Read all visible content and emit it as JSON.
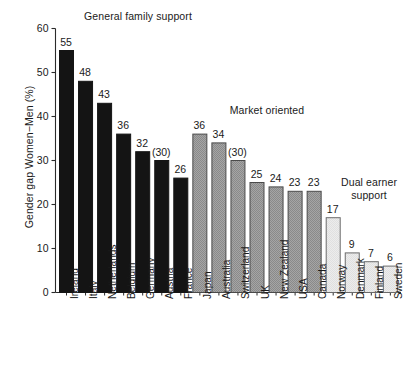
{
  "chart_data": {
    "type": "bar",
    "title": "",
    "xlabel": "",
    "ylabel": "Gender gap Women−Men (%)",
    "ylim": [
      0,
      60
    ],
    "ytick_values": [
      0,
      10,
      20,
      30,
      40,
      50,
      60
    ],
    "ytick_labels": [
      "0",
      "10",
      "20",
      "30",
      "40",
      "50",
      "60"
    ],
    "grid": false,
    "legend": "none",
    "categories": [
      "Ireland",
      "Italy",
      "Netherlands",
      "Belgium",
      "Germany",
      "Austria",
      "France",
      "Japan",
      "Australia",
      "Switzerland",
      "UK",
      "New Zealand",
      "USA",
      "Canada",
      "Norway",
      "Denmark",
      "Finland",
      "Sweden"
    ],
    "values": [
      55,
      48,
      43,
      36,
      32,
      30,
      26,
      36,
      34,
      30,
      25,
      24,
      23,
      23,
      17,
      9,
      7,
      6
    ],
    "value_labels": [
      "55",
      "48",
      "43",
      "36",
      "32",
      "(30)",
      "26",
      "36",
      "34",
      "(30)",
      "25",
      "24",
      "23",
      "23",
      "17",
      "9",
      "7",
      "6"
    ],
    "groups": [
      {
        "name": "General family support",
        "label": "General family support",
        "start": 0,
        "end": 6,
        "fill": "#141414",
        "stroke": "#141414"
      },
      {
        "name": "Market oriented",
        "label": "Market oriented",
        "start": 7,
        "end": 13,
        "fill": "#9b9b9b",
        "stroke": "#3c3c3c"
      },
      {
        "name": "Dual earner support",
        "label": "Dual earner\nsupport",
        "start": 14,
        "end": 17,
        "fill": "#e8e8e8",
        "stroke": "#5a5a5a"
      }
    ]
  },
  "colors": {
    "background": "#ffffff",
    "axis": "#2b2b2b",
    "text": "#1a1a1a",
    "group_general": "#141414",
    "group_market": "#9b9b9b",
    "group_dual": "#e8e8e8"
  }
}
